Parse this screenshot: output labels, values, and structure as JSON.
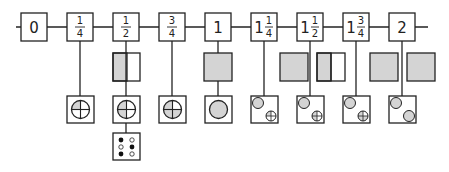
{
  "diagram": {
    "title": "",
    "colors": {
      "stroke": "#222222",
      "shade": "#d4d4d4",
      "background": "#ffffff",
      "dot": "#111111"
    },
    "nodes": [
      {
        "id": "n0",
        "whole": "0",
        "num": "",
        "den": "",
        "cx": 33,
        "square": "none",
        "circles": "none"
      },
      {
        "id": "n1q",
        "whole": "",
        "num": "1",
        "den": "4",
        "cx": 80,
        "square": "none",
        "circles": "q1"
      },
      {
        "id": "n1h",
        "whole": "",
        "num": "1",
        "den": "2",
        "cx": 126,
        "square": "half",
        "circles": "q2",
        "extra": "dice"
      },
      {
        "id": "n3q",
        "whole": "",
        "num": "3",
        "den": "4",
        "cx": 172,
        "square": "none",
        "circles": "q3"
      },
      {
        "id": "n1",
        "whole": "1",
        "num": "",
        "den": "",
        "cx": 218,
        "square": "full",
        "circles": "full"
      },
      {
        "id": "n1_1q",
        "whole": "1",
        "num": "1",
        "den": "4",
        "cx": 264,
        "square": "full-offset",
        "circles": "full+q1"
      },
      {
        "id": "n1_1h",
        "whole": "1",
        "num": "1",
        "den": "2",
        "cx": 310,
        "square": "full+half",
        "circles": "full+q2"
      },
      {
        "id": "n1_3q",
        "whole": "1",
        "num": "3",
        "den": "4",
        "cx": 356,
        "square": "full-offset",
        "circles": "full+q3"
      },
      {
        "id": "n2",
        "whole": "2",
        "num": "",
        "den": "",
        "cx": 402,
        "square": "two-full",
        "circles": "full+full"
      }
    ],
    "labels": {
      "n0": "0",
      "n1q": {
        "num": "1",
        "den": "4"
      },
      "n1h": {
        "num": "1",
        "den": "2"
      },
      "n3q": {
        "num": "3",
        "den": "4"
      },
      "n1": "1",
      "n1_1q": {
        "whole": "1",
        "num": "1",
        "den": "4"
      },
      "n1_1h": {
        "whole": "1",
        "num": "1",
        "den": "2"
      },
      "n1_3q": {
        "whole": "1",
        "num": "3",
        "den": "4"
      },
      "n2": "2"
    },
    "dice": {
      "filled": [
        true,
        false,
        false,
        true,
        true,
        false
      ]
    }
  }
}
